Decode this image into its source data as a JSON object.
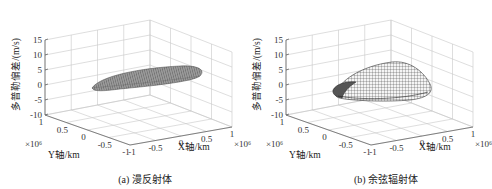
{
  "chart_data": [
    {
      "type": "surface3d",
      "caption": "(a) 漫反射体",
      "zlabel": "多普勒偏差/(m/s)",
      "xlabel": "X轴/km",
      "ylabel": "Y轴/km",
      "x_exponent": "×10⁶",
      "y_exponent": "×10⁶",
      "zlim": [
        -10,
        15
      ],
      "xlim": [
        -1,
        1
      ],
      "ylim": [
        -1,
        1
      ],
      "z_ticks": [
        "15",
        "10",
        "5",
        "0",
        "-5",
        "-10"
      ],
      "x_ticks": [
        "-1",
        "-0.5",
        "0",
        "0.5",
        "1"
      ],
      "y_ticks": [
        "1",
        "0.5",
        "0",
        "-0.5",
        "-1"
      ],
      "grid": true,
      "surface": {
        "shape": "flat elongated ellipsoid",
        "z_range_approx": [
          -4,
          2
        ]
      }
    },
    {
      "type": "surface3d",
      "caption": "(b) 余弦辐射体",
      "zlabel": "多普勒偏差/(m/s)",
      "xlabel": "X轴/km",
      "ylabel": "Y轴/km",
      "x_exponent": "×10⁶",
      "y_exponent": "×10⁶",
      "zlim": [
        -10,
        15
      ],
      "xlim": [
        -1,
        1
      ],
      "ylim": [
        -1,
        1
      ],
      "z_ticks": [
        "15",
        "10",
        "5",
        "0",
        "-5",
        "-10"
      ],
      "x_ticks": [
        "-1",
        "-0.5",
        "0",
        "0.5",
        "1"
      ],
      "y_ticks": [
        "1",
        "0.5",
        "0",
        "-0.5",
        "-1"
      ],
      "grid": true,
      "surface": {
        "shape": "dome with curled rim",
        "z_range_approx": [
          -5,
          7
        ]
      }
    }
  ],
  "panels": [
    {
      "caption": "(a) 漫反射体",
      "zlabel": "多普勒偏差/(m/s)",
      "xlabel": "X轴/km",
      "ylabel": "Y轴/km",
      "xexp": "×10⁶",
      "yexp": "×10⁶",
      "z_ticks": [
        "15",
        "10",
        "5",
        "0",
        "-5",
        "-10"
      ],
      "x_ticks": [
        "-1",
        "-0.5",
        "0",
        "0.5",
        "1"
      ],
      "y_ticks": [
        "1",
        "0.5",
        "0",
        "-0.5",
        "-1"
      ]
    },
    {
      "caption": "(b) 余弦辐射体",
      "zlabel": "多普勒偏差/(m/s)",
      "xlabel": "X轴/km",
      "ylabel": "Y轴/km",
      "xexp": "×10⁶",
      "yexp": "×10⁶",
      "z_ticks": [
        "15",
        "10",
        "5",
        "0",
        "-5",
        "-10"
      ],
      "x_ticks": [
        "-1",
        "-0.5",
        "0",
        "0.5",
        "1"
      ],
      "y_ticks": [
        "1",
        "0.5",
        "0",
        "-0.5",
        "-1"
      ]
    }
  ]
}
